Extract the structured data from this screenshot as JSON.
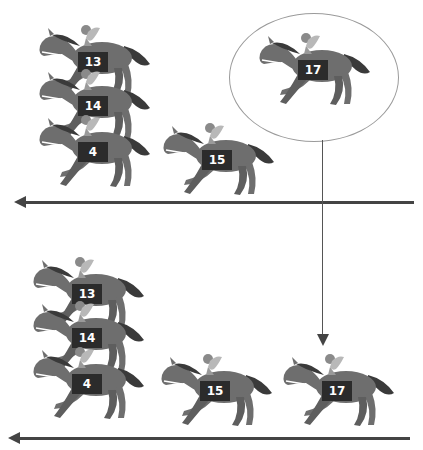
{
  "diagram": {
    "colors": {
      "horse_body": "#6e6e6e",
      "horse_dark": "#3a3a3a",
      "bib_background": "#2b2b2b",
      "bib_text": "#ffffff",
      "track_line": "#444444",
      "ellipse_border": "#9a9a9a"
    },
    "top_panel": {
      "horses": [
        {
          "number": "13",
          "group": "stacked"
        },
        {
          "number": "14",
          "group": "stacked"
        },
        {
          "number": "4",
          "group": "stacked"
        },
        {
          "number": "15",
          "group": "trailing"
        }
      ],
      "highlighted_horse": {
        "number": "17",
        "enclosed_in": "ellipse"
      },
      "direction_arrow": "left"
    },
    "bottom_panel": {
      "horses": [
        {
          "number": "13",
          "group": "stacked"
        },
        {
          "number": "14",
          "group": "stacked"
        },
        {
          "number": "4",
          "group": "stacked"
        },
        {
          "number": "15",
          "group": "trailing"
        },
        {
          "number": "17",
          "group": "trailing"
        }
      ],
      "direction_arrow": "left"
    },
    "connector": {
      "from": "ellipse-17-top",
      "to": "horse-17-bottom",
      "style": "down-arrow"
    }
  }
}
